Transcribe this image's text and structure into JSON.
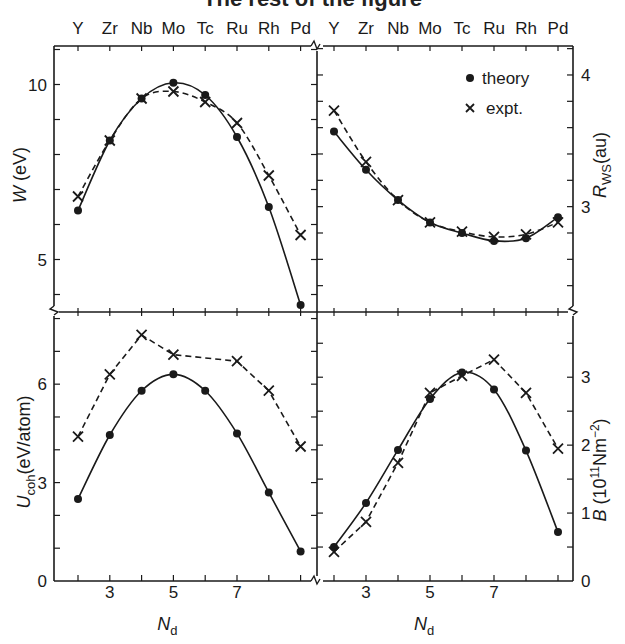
{
  "figure": {
    "title_partial": "The rest of the figure",
    "element_labels": [
      "Y",
      "Zr",
      "Nb",
      "Mo",
      "Tc",
      "Ru",
      "Rh",
      "Pd"
    ],
    "x_axis_label": "N",
    "x_axis_label_sub": "d",
    "x_tick_labels": [
      "3",
      "5",
      "7"
    ],
    "legend": {
      "theory": "theory",
      "expt": "expt."
    },
    "colors": {
      "ink": "#1a1a1a",
      "background": "#ffffff"
    }
  },
  "chart_data": [
    {
      "type": "line",
      "panel": "top-left",
      "title": "",
      "xlabel": "N_d",
      "ylabel": "W (eV)",
      "x": [
        2,
        3,
        4,
        5,
        6,
        7,
        8,
        9
      ],
      "categories": [
        "Y",
        "Zr",
        "Nb",
        "Mo",
        "Tc",
        "Ru",
        "Rh",
        "Pd"
      ],
      "y_ticks": [
        "5",
        "10"
      ],
      "ylim": [
        3.5,
        11.1
      ],
      "series": [
        {
          "name": "theory",
          "style": "solid",
          "marker": "dot",
          "values": [
            6.4,
            8.4,
            9.6,
            10.05,
            9.7,
            8.5,
            6.5,
            3.7
          ]
        },
        {
          "name": "expt.",
          "style": "dashed",
          "marker": "x",
          "values": [
            6.8,
            8.4,
            9.6,
            9.8,
            9.5,
            8.9,
            7.4,
            5.7
          ]
        }
      ]
    },
    {
      "type": "line",
      "panel": "top-right",
      "title": "",
      "xlabel": "N_d",
      "ylabel": "R_WS (au)",
      "x": [
        2,
        3,
        4,
        5,
        6,
        7,
        8,
        9
      ],
      "categories": [
        "Y",
        "Zr",
        "Nb",
        "Mo",
        "Tc",
        "Ru",
        "Rh",
        "Pd"
      ],
      "y_ticks": [
        "3",
        "4"
      ],
      "ylim": [
        2.2,
        4.22
      ],
      "legend_position": "upper right",
      "series": [
        {
          "name": "theory",
          "style": "solid",
          "marker": "dot",
          "values": [
            3.57,
            3.28,
            3.05,
            2.88,
            2.8,
            2.74,
            2.76,
            2.92
          ]
        },
        {
          "name": "expt.",
          "style": "dashed",
          "marker": "x",
          "values": [
            3.73,
            3.34,
            3.05,
            2.88,
            2.81,
            2.77,
            2.79,
            2.88
          ]
        }
      ]
    },
    {
      "type": "line",
      "panel": "bottom-left",
      "title": "",
      "xlabel": "N_d",
      "ylabel": "U_coh (eV/atom)",
      "x": [
        2,
        3,
        4,
        5,
        6,
        7,
        8,
        9
      ],
      "x_ticks": [
        "3",
        "5",
        "7"
      ],
      "y_ticks": [
        "0",
        "3",
        "6"
      ],
      "ylim": [
        0,
        8.2
      ],
      "series": [
        {
          "name": "theory",
          "style": "solid",
          "marker": "dot",
          "values": [
            2.5,
            4.45,
            5.8,
            6.3,
            5.8,
            4.5,
            2.7,
            0.9
          ]
        },
        {
          "name": "expt.",
          "style": "dashed",
          "marker": "x",
          "x": [
            2,
            3,
            4,
            5,
            7,
            8,
            9
          ],
          "values": [
            4.4,
            6.3,
            7.5,
            6.9,
            6.7,
            5.8,
            4.1
          ]
        }
      ]
    },
    {
      "type": "line",
      "panel": "bottom-right",
      "title": "",
      "xlabel": "N_d",
      "ylabel": "B (10^11 Nm^-2)",
      "x": [
        2,
        3,
        4,
        5,
        6,
        7,
        8,
        9
      ],
      "x_ticks": [
        "3",
        "5",
        "7"
      ],
      "y_ticks": [
        "0",
        "1",
        "2",
        "3"
      ],
      "ylim": [
        0,
        3.96
      ],
      "series": [
        {
          "name": "theory",
          "style": "solid",
          "marker": "dot",
          "values": [
            0.5,
            1.15,
            1.93,
            2.68,
            3.07,
            2.82,
            1.92,
            0.72
          ]
        },
        {
          "name": "expt.",
          "style": "dashed",
          "marker": "x",
          "values": [
            0.43,
            0.87,
            1.74,
            2.77,
            3.02,
            3.26,
            2.77,
            1.95
          ]
        }
      ]
    }
  ]
}
